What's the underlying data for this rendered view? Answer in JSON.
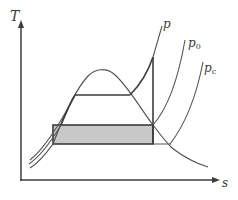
{
  "diagram": {
    "type": "T-s diagram (temperature-entropy)",
    "axes": {
      "y_label": "T",
      "x_label": "s"
    },
    "curves": {
      "p": {
        "label": "p",
        "sub": ""
      },
      "p0": {
        "label": "p",
        "sub": "0"
      },
      "pc": {
        "label": "p",
        "sub": "c"
      }
    },
    "regions": {
      "shaded_area": "work area between p0 and pc isobars"
    },
    "colors": {
      "line": "#555555",
      "dark_line": "#3c3c3c",
      "shade": "#c8c8c8",
      "background": "#ffffff"
    }
  }
}
